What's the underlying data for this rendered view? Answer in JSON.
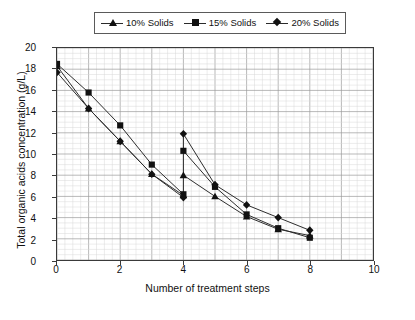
{
  "chart_data": {
    "type": "line",
    "title": "",
    "xlabel": "Number of treatment steps",
    "ylabel": "Total organic acids concentration (g/L)",
    "xlim": [
      0,
      10
    ],
    "ylim": [
      0,
      20
    ],
    "xticks": [
      0,
      2,
      4,
      6,
      8,
      10
    ],
    "yticks": [
      0,
      2,
      4,
      6,
      8,
      10,
      12,
      14,
      16,
      18,
      20
    ],
    "xtick_labels": [
      "0",
      "2",
      "4",
      "6",
      "8",
      "10"
    ],
    "ytick_labels": [
      "0",
      "2",
      "4",
      "6",
      "8",
      "10",
      "12",
      "14",
      "16",
      "18",
      "20"
    ],
    "grid": true,
    "grid_minor_x": 0.25,
    "grid_minor_y": 0.5,
    "legend_position": "top",
    "legend_entries": [
      "10% Solids",
      "15% Solids",
      "20% Solids"
    ],
    "series": [
      {
        "name": "10% Solids",
        "marker": "triangle",
        "segments": [
          {
            "x": [
              0,
              1,
              2,
              3,
              4
            ],
            "y": [
              18.3,
              14.3,
              11.2,
              8.1,
              6.1
            ]
          },
          {
            "x": [
              4,
              5,
              6,
              7,
              8
            ],
            "y": [
              8.0,
              6.0,
              4.1,
              2.9,
              2.3
            ]
          }
        ]
      },
      {
        "name": "15% Solids",
        "marker": "square",
        "segments": [
          {
            "x": [
              0,
              1,
              2,
              3,
              4
            ],
            "y": [
              18.5,
              15.8,
              12.7,
              9.0,
              6.2
            ]
          },
          {
            "x": [
              4,
              5,
              6,
              7,
              8
            ],
            "y": [
              10.3,
              6.9,
              4.3,
              3.0,
              2.1
            ]
          }
        ]
      },
      {
        "name": "20% Solids",
        "marker": "diamond",
        "segments": [
          {
            "x": [
              0,
              1,
              2,
              3,
              4
            ],
            "y": [
              17.7,
              14.3,
              11.2,
              8.1,
              5.9
            ]
          },
          {
            "x": [
              4,
              5,
              6,
              7,
              8
            ],
            "y": [
              11.9,
              7.1,
              5.2,
              4.0,
              2.8
            ]
          }
        ]
      }
    ],
    "connectors": [
      {
        "x": 4,
        "y0": 6.1,
        "y1": 11.9
      }
    ],
    "colors": {
      "line": "#2a2a2a",
      "marker": "#111111",
      "grid_major": "#9a9a9a",
      "grid_minor": "#d8d8d8",
      "axis": "#3a3a3a",
      "background": "#ffffff"
    }
  }
}
